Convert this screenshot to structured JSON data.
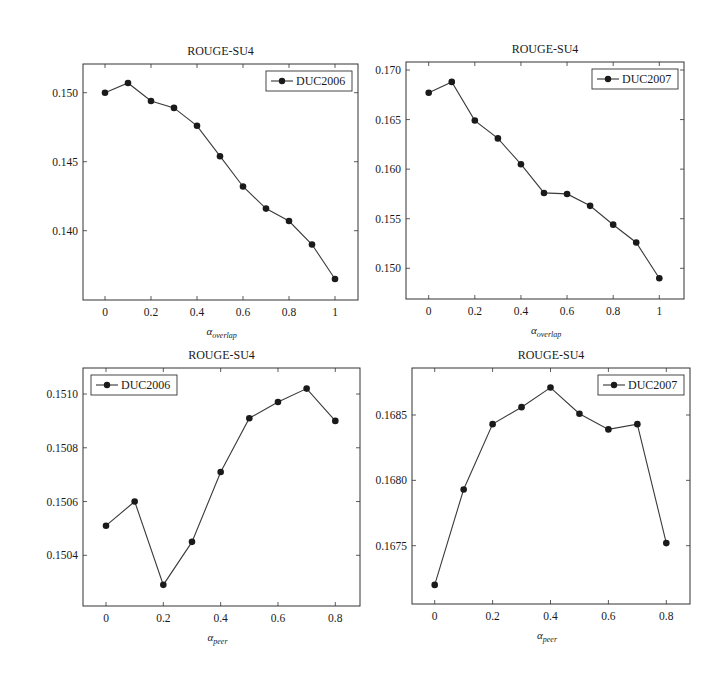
{
  "figure": {
    "panels": [
      {
        "id": "top-left",
        "title": "ROUGE-SU4",
        "xlabel_main": "α",
        "xlabel_sub": "overlap",
        "legend_label": "DUC2006",
        "legend_pos": "top-right",
        "frame": {
          "left": 83,
          "right": 358,
          "top": 64,
          "bottom": 300
        },
        "x_axis": {
          "v0": 0,
          "p0": 105,
          "v1": 1,
          "p1": 335
        },
        "y_axis": {
          "v0": 0.15,
          "p0": 92.7,
          "v1": 0.14,
          "p1": 230.7
        },
        "xticks": [
          "0",
          "0.2",
          "0.4",
          "0.6",
          "0.8",
          "1"
        ],
        "xtick_values": [
          0,
          0.2,
          0.4,
          0.6,
          0.8,
          1
        ],
        "yticks": [
          "0.140",
          "0.145",
          "0.150"
        ],
        "ytick_values": [
          0.14,
          0.145,
          0.15
        ]
      },
      {
        "id": "top-right",
        "title": "ROUGE-SU4",
        "xlabel_main": "α",
        "xlabel_sub": "overlap",
        "legend_label": "DUC2007",
        "legend_pos": "top-right",
        "frame": {
          "left": 406,
          "right": 684,
          "top": 62,
          "bottom": 299
        },
        "x_axis": {
          "v0": 0,
          "p0": 428.7,
          "v1": 1,
          "p1": 659.3
        },
        "y_axis": {
          "v0": 0.17,
          "p0": 70,
          "v1": 0.15,
          "p1": 268.3
        },
        "xticks": [
          "0",
          "0.2",
          "0.4",
          "0.6",
          "0.8",
          "1"
        ],
        "xtick_values": [
          0,
          0.2,
          0.4,
          0.6,
          0.8,
          1
        ],
        "yticks": [
          "0.150",
          "0.155",
          "0.160",
          "0.165",
          "0.170"
        ],
        "ytick_values": [
          0.15,
          0.155,
          0.16,
          0.165,
          0.17
        ]
      },
      {
        "id": "bottom-left",
        "title": "ROUGE-SU4",
        "xlabel_main": "α",
        "xlabel_sub": "peer",
        "legend_label": "DUC2006",
        "legend_pos": "top-left",
        "frame": {
          "left": 83,
          "right": 360,
          "top": 368,
          "bottom": 606
        },
        "x_axis": {
          "v0": 0,
          "p0": 106,
          "v1": 0.8,
          "p1": 335.3
        },
        "y_axis": {
          "v0": 0.151,
          "p0": 394,
          "v1": 0.1504,
          "p1": 555.3
        },
        "xticks": [
          "0",
          "0.2",
          "0.4",
          "0.6",
          "0.8"
        ],
        "xtick_values": [
          0,
          0.2,
          0.4,
          0.6,
          0.8
        ],
        "yticks": [
          "0.1504",
          "0.1506",
          "0.1508",
          "0.1510"
        ],
        "ytick_values": [
          0.1504,
          0.1506,
          0.1508,
          0.151
        ]
      },
      {
        "id": "bottom-right",
        "title": "ROUGE-SU4",
        "xlabel_main": "α",
        "xlabel_sub": "peer",
        "legend_label": "DUC2007",
        "legend_pos": "top-right",
        "frame": {
          "left": 412,
          "right": 690,
          "top": 368,
          "bottom": 604
        },
        "x_axis": {
          "v0": 0,
          "p0": 434.7,
          "v1": 0.8,
          "p1": 666.3
        },
        "y_axis": {
          "v0": 0.1685,
          "p0": 415,
          "v1": 0.1675,
          "p1": 545.7
        },
        "xticks": [
          "0",
          "0.2",
          "0.4",
          "0.6",
          "0.8"
        ],
        "xtick_values": [
          0,
          0.2,
          0.4,
          0.6,
          0.8
        ],
        "yticks": [
          "0.1675",
          "0.1680",
          "0.1685"
        ],
        "ytick_values": [
          0.1675,
          0.168,
          0.1685
        ]
      }
    ]
  },
  "chart_data": [
    {
      "type": "line",
      "title": "ROUGE-SU4",
      "xlabel": "α_overlap",
      "ylabel": "",
      "x": [
        0,
        0.1,
        0.2,
        0.3,
        0.4,
        0.5,
        0.6,
        0.7,
        0.8,
        0.9,
        1.0
      ],
      "series": [
        {
          "name": "DUC2006",
          "values": [
            0.15,
            0.1507,
            0.1494,
            0.1489,
            0.1476,
            0.1454,
            0.1432,
            0.1416,
            0.1407,
            0.139,
            0.1365
          ]
        }
      ],
      "xticks": [
        "0",
        "0.2",
        "0.4",
        "0.6",
        "0.8",
        "1"
      ],
      "yticks": [
        "0.140",
        "0.145",
        "0.150"
      ],
      "xlim": [
        -0.1,
        1.1
      ],
      "ylim": [
        0.1353,
        0.1521
      ],
      "grid": false,
      "legend_position": "upper right",
      "marker": "filled circle"
    },
    {
      "type": "line",
      "title": "ROUGE-SU4",
      "xlabel": "α_overlap",
      "ylabel": "",
      "x": [
        0,
        0.1,
        0.2,
        0.3,
        0.4,
        0.5,
        0.6,
        0.7,
        0.8,
        0.9,
        1.0
      ],
      "series": [
        {
          "name": "DUC2007",
          "values": [
            0.1677,
            0.1688,
            0.1649,
            0.1631,
            0.1605,
            0.1576,
            0.1575,
            0.1563,
            0.1544,
            0.1526,
            0.149
          ]
        }
      ],
      "xticks": [
        "0",
        "0.2",
        "0.4",
        "0.6",
        "0.8",
        "1"
      ],
      "yticks": [
        "0.150",
        "0.155",
        "0.160",
        "0.165",
        "0.170"
      ],
      "xlim": [
        -0.1,
        1.1
      ],
      "ylim": [
        0.1472,
        0.1702
      ],
      "grid": false,
      "legend_position": "upper right",
      "marker": "filled circle"
    },
    {
      "type": "line",
      "title": "ROUGE-SU4",
      "xlabel": "α_peer",
      "ylabel": "",
      "x": [
        0,
        0.1,
        0.2,
        0.3,
        0.4,
        0.5,
        0.6,
        0.7,
        0.8
      ],
      "series": [
        {
          "name": "DUC2006",
          "values": [
            0.15051,
            0.1506,
            0.15029,
            0.15045,
            0.15071,
            0.15091,
            0.15097,
            0.15102,
            0.1509
          ]
        }
      ],
      "xticks": [
        "0",
        "0.2",
        "0.4",
        "0.6",
        "0.8"
      ],
      "yticks": [
        "0.1504",
        "0.1506",
        "0.1508",
        "0.1510"
      ],
      "xlim": [
        -0.08,
        0.88
      ],
      "ylim": [
        0.15021,
        0.15119
      ],
      "grid": false,
      "legend_position": "upper left",
      "marker": "filled circle"
    },
    {
      "type": "line",
      "title": "ROUGE-SU4",
      "xlabel": "α_peer",
      "ylabel": "",
      "x": [
        0,
        0.1,
        0.2,
        0.3,
        0.4,
        0.5,
        0.6,
        0.7,
        0.8
      ],
      "series": [
        {
          "name": "DUC2007",
          "values": [
            0.1672,
            0.16793,
            0.16843,
            0.16856,
            0.16871,
            0.16851,
            0.16839,
            0.16843,
            0.16752
          ]
        }
      ],
      "xticks": [
        "0",
        "0.2",
        "0.4",
        "0.6",
        "0.8"
      ],
      "yticks": [
        "0.1675",
        "0.1680",
        "0.1685"
      ],
      "xlim": [
        -0.08,
        0.88
      ],
      "ylim": [
        0.16706,
        0.16887
      ],
      "grid": false,
      "legend_position": "upper right",
      "marker": "filled circle"
    }
  ]
}
